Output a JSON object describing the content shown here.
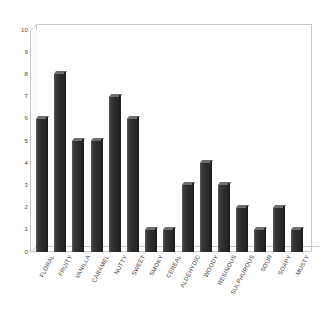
{
  "chart_data": {
    "type": "bar",
    "title": "",
    "subtitle": "",
    "xlabel": "",
    "ylabel": "",
    "ylim": [
      0,
      10
    ],
    "ytick_step": 1,
    "yticks": [
      "10",
      "9",
      "8",
      "7",
      "6",
      "5",
      "4",
      "3",
      "2",
      "1",
      "0"
    ],
    "grid": false,
    "legend": "none",
    "bar_color": "#2d2d2d",
    "background_color": "#ffffff",
    "frame_color": "#c9c9c9",
    "categories": [
      "FLORAL",
      "FRUITY",
      "VANILLA",
      "CARAMEL",
      "NUTTY",
      "SWEET",
      "SMOKY",
      "CEREAL",
      "ALDEHYDIC",
      "WOODY",
      "RESINOUS",
      "SULPHUROUS",
      "SOUR",
      "SOAPY",
      "MUSTY"
    ],
    "values": [
      6,
      8,
      5,
      5,
      7,
      6,
      1,
      1,
      3,
      4,
      3,
      2,
      1,
      2,
      1
    ]
  }
}
